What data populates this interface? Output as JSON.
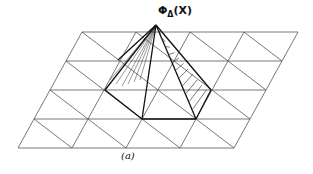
{
  "diagram": {
    "apex_label": {
      "symbol": "Φ",
      "subscript": "Δ",
      "argument": "(X)"
    },
    "caption": "(a)",
    "grid": {
      "rows": 4,
      "columns": 4,
      "row_y": [
        32,
        61,
        90,
        119,
        148
      ],
      "top_left_x": 82,
      "column_spacing": 54,
      "row_shift": -16,
      "line_color": "#555555"
    },
    "pyramid": {
      "apex": [
        156,
        25
      ],
      "base": [
        [
          105,
          90
        ],
        [
          142,
          119
        ],
        [
          196,
          119
        ],
        [
          211,
          90
        ]
      ],
      "line_color": "#111111"
    }
  }
}
